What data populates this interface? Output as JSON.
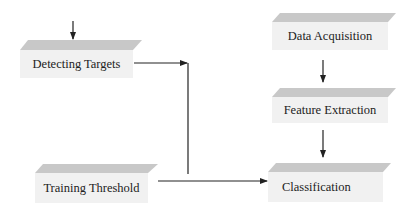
{
  "diagram": {
    "nodes": [
      {
        "id": "detecting-targets",
        "label": "Detecting Targets",
        "x": 20,
        "y": 40,
        "w": 113,
        "h": 38
      },
      {
        "id": "data-acquisition",
        "label": "Data Acquisition",
        "x": 272,
        "y": 13,
        "w": 116,
        "h": 37
      },
      {
        "id": "feature-extraction",
        "label": "Feature Extraction",
        "x": 272,
        "y": 88,
        "w": 116,
        "h": 35
      },
      {
        "id": "training-threshold",
        "label": "Training Threshold",
        "x": 35,
        "y": 164,
        "w": 113,
        "h": 39
      },
      {
        "id": "classification",
        "label": "Classification",
        "x": 268,
        "y": 163,
        "w": 115,
        "h": 39
      }
    ],
    "edges": [
      {
        "from": "input",
        "to": "detecting-targets"
      },
      {
        "from": "detecting-targets",
        "to": "classification"
      },
      {
        "from": "data-acquisition",
        "to": "feature-extraction"
      },
      {
        "from": "feature-extraction",
        "to": "classification"
      },
      {
        "from": "training-threshold",
        "to": "classification"
      }
    ],
    "colors": {
      "top_face": "#c8c8c8",
      "front_face": "#f1f1f1",
      "line": "#222222"
    }
  }
}
